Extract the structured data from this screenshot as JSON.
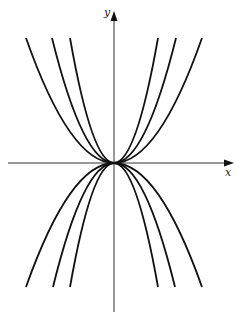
{
  "figure": {
    "type": "family-of-parabolas",
    "axis_labels": {
      "x": "x",
      "y": "y"
    },
    "origin_px": [
      114,
      163
    ],
    "curves": {
      "upward": [
        {
          "name": "y = a1 x^2",
          "half_width_px": 44
        },
        {
          "name": "y = a2 x^2",
          "half_width_px": 62
        },
        {
          "name": "y = a3 x^2",
          "half_width_px": 88
        }
      ],
      "downward": [
        {
          "name": "y = -a1 x^2",
          "half_width_px": 44
        },
        {
          "name": "y = -a2 x^2",
          "half_width_px": 61
        },
        {
          "name": "y = -a3 x^2",
          "half_width_px": 88
        }
      ]
    },
    "colors": {
      "stroke": "#111111",
      "axis": "#333333",
      "background": "#ffffff"
    }
  }
}
